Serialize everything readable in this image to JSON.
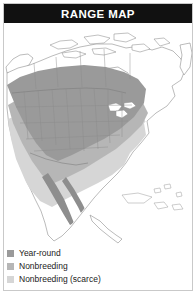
{
  "header": {
    "title": "RANGE MAP",
    "background_color": "#111111",
    "text_color": "#ffffff"
  },
  "map": {
    "region": "North America",
    "background_color": "#ffffff",
    "coastline_color": "#8d8d8d",
    "border_color": "#7a7a7a",
    "state_border_color": "#8a8a8a",
    "areas": [
      {
        "name": "year-round-range",
        "color": "#9a9a9a"
      },
      {
        "name": "nonbreeding-range",
        "color": "#b6b6b6"
      },
      {
        "name": "nonbreeding-scarce-range",
        "color": "#d6d6d6"
      }
    ]
  },
  "legend": {
    "items": [
      {
        "label": "Year-round",
        "color": "#9a9a9a",
        "swatch_name": "year-round-swatch"
      },
      {
        "label": "Nonbreeding",
        "color": "#b6b6b6",
        "swatch_name": "nonbreeding-swatch"
      },
      {
        "label": "Nonbreeding (scarce)",
        "color": "#d6d6d6",
        "swatch_name": "nonbreeding-scarce-swatch"
      }
    ]
  },
  "frame": {
    "border_color": "#c9c9c9"
  }
}
